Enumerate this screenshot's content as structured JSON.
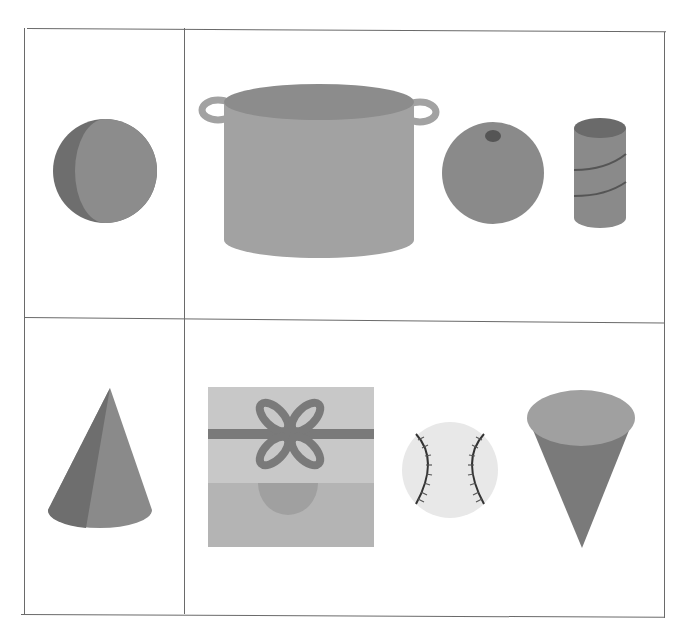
{
  "worksheet": {
    "layout": "2x2 table",
    "rows": [
      {
        "row": 1,
        "left_cell": {
          "shape": "sphere"
        },
        "right_cell": {
          "items": [
            "cooking-pot",
            "orange",
            "tin-can"
          ]
        }
      },
      {
        "row": 2,
        "left_cell": {
          "shape": "cone"
        },
        "right_cell": {
          "items": [
            "gift-box",
            "baseball",
            "ice-cream-cone"
          ]
        }
      }
    ]
  },
  "colors": {
    "border": "#6a6a6a",
    "shape_dark": "#6e6e6e",
    "shape_mid": "#8a8a8a",
    "shape_light": "#a0a0a0",
    "box_light": "#c8c8c8",
    "box_lower": "#b4b4b4",
    "ball": "#e8e8e8",
    "stitch": "#333333"
  }
}
